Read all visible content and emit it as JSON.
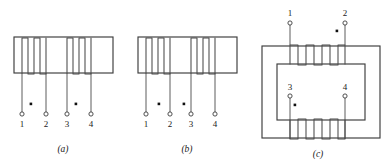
{
  "figure": {
    "background_color": "#ffffff",
    "line_color": "#3c3c3c",
    "coil_color": "#4a4a4a",
    "dot_color": "#101010",
    "terminal_fill": "#ffffff"
  },
  "panels": [
    {
      "id": "a",
      "caption": "(a)",
      "core_type": "straight-bar-core",
      "winding_count": 2,
      "turns_per_winding": 3,
      "terminals": [
        {
          "label": "1",
          "x": 26,
          "y": 118
        },
        {
          "label": "2",
          "x": 52,
          "y": 118
        },
        {
          "label": "3",
          "x": 71,
          "y": 118
        },
        {
          "label": "4",
          "x": 98,
          "y": 118
        }
      ],
      "dots": [
        {
          "x": 31,
          "y": 105
        },
        {
          "x": 76,
          "y": 105
        }
      ]
    },
    {
      "id": "b",
      "caption": "(b)",
      "core_type": "straight-bar-core",
      "winding_count": 2,
      "turns_per_winding": 3,
      "terminals": [
        {
          "label": "1",
          "x": 150,
          "y": 118
        },
        {
          "label": "2",
          "x": 176,
          "y": 118
        },
        {
          "label": "3",
          "x": 195,
          "y": 118
        },
        {
          "label": "4",
          "x": 222,
          "y": 118
        }
      ],
      "dots": [
        {
          "x": 170,
          "y": 105
        },
        {
          "x": 200,
          "y": 105
        }
      ]
    },
    {
      "id": "c",
      "caption": "(c)",
      "core_type": "window-core",
      "winding_count": 2,
      "turns_per_winding": 6,
      "terminals": [
        {
          "label": "1",
          "x": 290,
          "y": 23
        },
        {
          "label": "2",
          "x": 345,
          "y": 23
        },
        {
          "label": "3",
          "x": 292,
          "y": 96
        },
        {
          "label": "4",
          "x": 345,
          "y": 96
        }
      ],
      "dots": [
        {
          "x": 337,
          "y": 31
        },
        {
          "x": 295,
          "y": 105
        }
      ]
    }
  ],
  "captions": {
    "a": "(a)",
    "b": "(b)",
    "c": "(c)"
  },
  "terminal_labels": {
    "one": "1",
    "two": "2",
    "three": "3",
    "four": "4"
  }
}
